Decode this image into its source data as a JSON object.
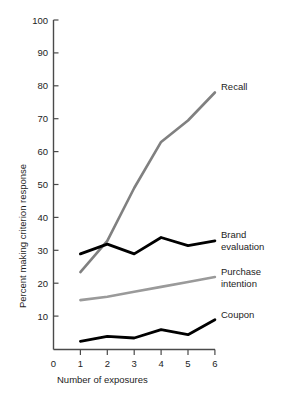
{
  "chart_data": {
    "type": "line",
    "title": "",
    "xlabel": "Number of exposures",
    "ylabel": "Percent making criterion response",
    "x": [
      1,
      2,
      3,
      4,
      5,
      6
    ],
    "xticks": [
      "0",
      "1",
      "2",
      "3",
      "4",
      "5",
      "6"
    ],
    "yticks": [
      "10",
      "20",
      "30",
      "40",
      "50",
      "60",
      "70",
      "80",
      "90",
      "100"
    ],
    "xlim": [
      0,
      6
    ],
    "ylim": [
      0,
      100
    ],
    "grid": false,
    "legend_position": "right-inline-labels",
    "series": [
      {
        "name": "Recall",
        "label": "Recall",
        "color": "#808080",
        "values": [
          23.5,
          33,
          49,
          63,
          69.5,
          78
        ]
      },
      {
        "name": "Brand evaluation",
        "label": "Brand\nevaluation",
        "label_line1": "Brand",
        "label_line2": "evaluation",
        "color": "#000000",
        "values": [
          29,
          32,
          29,
          34,
          31.5,
          33
        ]
      },
      {
        "name": "Purchase intention",
        "label": "Purchase\nintention",
        "label_line1": "Purchase",
        "label_line2": "intention",
        "color": "#9a9a9a",
        "values": [
          15,
          16,
          17.5,
          19,
          20.5,
          22
        ]
      },
      {
        "name": "Coupon",
        "label": "Coupon",
        "color": "#000000",
        "values": [
          2.5,
          4,
          3.5,
          6,
          4.5,
          9
        ]
      }
    ]
  },
  "axis": {
    "x_title": "Number of exposures",
    "y_title": "Percent making criterion response",
    "x_tick_0": "0",
    "x_tick_1": "1",
    "x_tick_2": "2",
    "x_tick_3": "3",
    "x_tick_4": "4",
    "x_tick_5": "5",
    "x_tick_6": "6",
    "y_tick_10": "10",
    "y_tick_20": "20",
    "y_tick_30": "30",
    "y_tick_40": "40",
    "y_tick_50": "50",
    "y_tick_60": "60",
    "y_tick_70": "70",
    "y_tick_80": "80",
    "y_tick_90": "90",
    "y_tick_100": "100"
  },
  "labels": {
    "recall": "Recall",
    "brand_line1": "Brand",
    "brand_line2": "evaluation",
    "purchase_line1": "Purchase",
    "purchase_line2": "intention",
    "coupon": "Coupon"
  }
}
